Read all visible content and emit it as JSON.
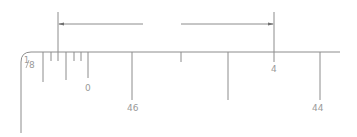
{
  "drawing": {
    "type": "dimensioned ruler fragment",
    "line_color": "#8c8c8c",
    "text_color": "#9a9a9a",
    "labels": {
      "corner_fraction_num": "1",
      "corner_fraction_den": "8",
      "tick_zero": "0",
      "tick_46": "46",
      "tick_4": "4",
      "tick_44": "44"
    },
    "dimension": {
      "left_arrow": "arrow-left",
      "right_arrow": "arrow-right"
    }
  }
}
